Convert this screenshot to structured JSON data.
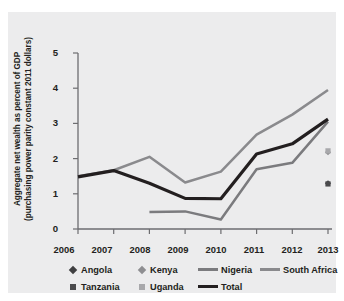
{
  "chart_data": {
    "type": "line",
    "title": "",
    "xlabel": "",
    "ylabel": "Aggregate net wealth as percent of GDP (purchasing power parity constant 2011 dollars)",
    "ylabel_line1": "Aggregate net wealth as percent of GDP",
    "ylabel_line2": "(purchasing power parity constant 2011 dollars)",
    "categories": [
      "2006",
      "2007",
      "2008",
      "2009",
      "2010",
      "2011",
      "2012",
      "2013"
    ],
    "x": [
      2006,
      2007,
      2008,
      2009,
      2010,
      2011,
      2012,
      2013
    ],
    "ylim": [
      0,
      5
    ],
    "yticks": [
      "0",
      "1",
      "2",
      "3",
      "4",
      "5"
    ],
    "ytick_values": [
      0,
      1,
      2,
      3,
      4,
      5
    ],
    "grid": false,
    "legend_position": "bottom",
    "series": [
      {
        "name": "Angola",
        "kind": "marker",
        "marker": "diamond",
        "color": "#3f3f41",
        "x": [
          2013
        ],
        "values": [
          1.3
        ]
      },
      {
        "name": "Kenya",
        "kind": "marker",
        "marker": "diamond",
        "color": "#8e8e91",
        "x": [
          2013
        ],
        "values": [
          2.18
        ]
      },
      {
        "name": "Nigeria",
        "kind": "line",
        "color": "#7b7b7e",
        "x": [
          2008,
          2009,
          2010,
          2011,
          2012,
          2013
        ],
        "values": [
          0.48,
          0.5,
          0.27,
          1.7,
          1.88,
          3.05
        ]
      },
      {
        "name": "South Africa",
        "kind": "line",
        "color": "#8a8a8d",
        "x": [
          2006,
          2007,
          2008,
          2009,
          2010,
          2011,
          2012,
          2013
        ],
        "values": [
          1.5,
          1.67,
          2.05,
          1.32,
          1.63,
          2.68,
          3.25,
          3.95
        ]
      },
      {
        "name": "Tanzania",
        "kind": "marker",
        "marker": "square",
        "color": "#4a4a4c",
        "x": [
          2013
        ],
        "values": [
          1.28
        ]
      },
      {
        "name": "Uganda",
        "kind": "marker",
        "marker": "square",
        "color": "#a8a8ab",
        "x": [
          2013
        ],
        "values": [
          2.22
        ]
      },
      {
        "name": "Total",
        "kind": "line",
        "color": "#231f20",
        "x": [
          2006,
          2007,
          2008,
          2009,
          2010,
          2011,
          2012,
          2013
        ],
        "values": [
          1.48,
          1.66,
          1.3,
          0.87,
          0.86,
          2.13,
          2.42,
          3.12
        ]
      }
    ]
  },
  "legend": {
    "row1": [
      {
        "label": "Angola",
        "swatch": "diamond",
        "color": "#3f3f41"
      },
      {
        "label": "Kenya",
        "swatch": "diamond",
        "color": "#8e8e91"
      },
      {
        "label": "Nigeria",
        "swatch": "line-thin",
        "color": "#7b7b7e"
      },
      {
        "label": "South Africa",
        "swatch": "line-thin",
        "color": "#8a8a8d"
      }
    ],
    "row2": [
      {
        "label": "Tanzania",
        "swatch": "square",
        "color": "#4a4a4c"
      },
      {
        "label": "Uganda",
        "swatch": "square",
        "color": "#a8a8ab"
      },
      {
        "label": "Total",
        "swatch": "line-thick",
        "color": "#231f20"
      }
    ]
  },
  "colors": {
    "panel_background": "#ececed",
    "figure_background": "#ffffff",
    "axis": "#6d6d70",
    "text": "#231f20"
  }
}
